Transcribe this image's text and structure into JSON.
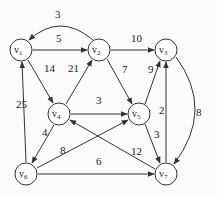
{
  "graph": {
    "nodes": [
      {
        "id": "v1",
        "label": "v",
        "sub": "1",
        "x": 21,
        "y": 50
      },
      {
        "id": "v2",
        "label": "v",
        "sub": "2",
        "x": 99,
        "y": 50
      },
      {
        "id": "v3",
        "label": "v",
        "sub": "3",
        "x": 166,
        "y": 50
      },
      {
        "id": "v4",
        "label": "v",
        "sub": "4",
        "x": 59,
        "y": 114
      },
      {
        "id": "v5",
        "label": "v",
        "sub": "5",
        "x": 139,
        "y": 114
      },
      {
        "id": "v6",
        "label": "v",
        "sub": "6",
        "x": 26,
        "y": 174
      },
      {
        "id": "v7",
        "label": "v",
        "sub": "7",
        "x": 166,
        "y": 174
      }
    ],
    "edges": [
      {
        "from": "v2",
        "to": "v1",
        "weight": "3"
      },
      {
        "from": "v1",
        "to": "v2",
        "weight": "5"
      },
      {
        "from": "v1",
        "to": "v4",
        "weight": "14"
      },
      {
        "from": "v4",
        "to": "v2",
        "weight": "21"
      },
      {
        "from": "v2",
        "to": "v3",
        "weight": "10"
      },
      {
        "from": "v2",
        "to": "v5",
        "weight": "7"
      },
      {
        "from": "v5",
        "to": "v3",
        "weight": "9"
      },
      {
        "from": "v7",
        "to": "v3",
        "weight": "2"
      },
      {
        "from": "v3",
        "to": "v7",
        "weight": "8"
      },
      {
        "from": "v4",
        "to": "v5",
        "weight": "3"
      },
      {
        "from": "v5",
        "to": "v7",
        "weight": "3"
      },
      {
        "from": "v6",
        "to": "v1",
        "weight": "25"
      },
      {
        "from": "v4",
        "to": "v6",
        "weight": "4"
      },
      {
        "from": "v6",
        "to": "v5",
        "weight": "8"
      },
      {
        "from": "v6",
        "to": "v7",
        "weight": "6"
      },
      {
        "from": "v7",
        "to": "v4",
        "weight": "12"
      }
    ]
  }
}
